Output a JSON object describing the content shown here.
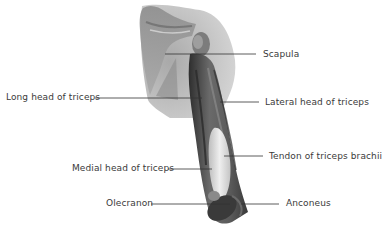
{
  "diagram": {
    "colors": {
      "background": "#ffffff",
      "label_text": "#3a3a3a",
      "leader_line": "#333333",
      "muscle_dark": "#3c3c3c",
      "muscle_mid": "#7a7a7a",
      "skin_light": "#c8c8c8",
      "tendon": "#e6e6e6"
    },
    "labels": [
      {
        "id": "scapula",
        "text": "Scapula",
        "side": "right",
        "text_x": 263,
        "text_y": 55,
        "line": [
          165,
          54,
          256,
          54
        ]
      },
      {
        "id": "long-head-of-triceps",
        "text": "Long head of triceps",
        "side": "left",
        "text_x": 6,
        "text_y": 98,
        "line": [
          95,
          98,
          202,
          98
        ]
      },
      {
        "id": "lateral-head-of-triceps",
        "text": "Lateral head of triceps",
        "side": "right",
        "text_x": 265,
        "text_y": 103,
        "line": [
          220,
          102,
          259,
          102
        ]
      },
      {
        "id": "tendon-of-triceps-brachii",
        "text": "Tendon of triceps brachii",
        "side": "right",
        "text_x": 269,
        "text_y": 157,
        "line": [
          224,
          156,
          263,
          156
        ]
      },
      {
        "id": "medial-head-of-triceps",
        "text": "Medial head of triceps",
        "side": "left",
        "text_x": 72,
        "text_y": 169,
        "line": [
          168,
          169,
          212,
          169
        ]
      },
      {
        "id": "olecranon",
        "text": "Olecranon",
        "side": "left",
        "text_x": 106,
        "text_y": 204,
        "line": [
          151,
          204,
          230,
          204
        ]
      },
      {
        "id": "anconeus",
        "text": "Anconeus",
        "side": "right",
        "text_x": 286,
        "text_y": 204,
        "line": [
          241,
          204,
          279,
          204
        ]
      }
    ]
  }
}
